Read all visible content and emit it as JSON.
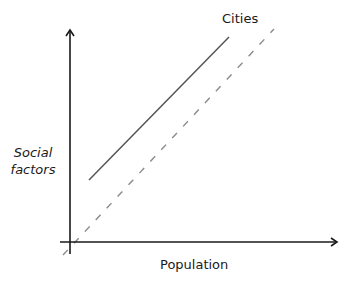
{
  "diagram": {
    "type": "conceptual line diagram",
    "x_axis": {
      "label": "Population"
    },
    "y_axis": {
      "label_line1": "Social",
      "label_line2": "factors"
    },
    "series": [
      {
        "name": "Cities",
        "style": "solid",
        "color": "#555555"
      },
      {
        "name": "reference",
        "style": "dashed",
        "color": "#8a8a8a"
      }
    ],
    "series_label": "Cities"
  }
}
